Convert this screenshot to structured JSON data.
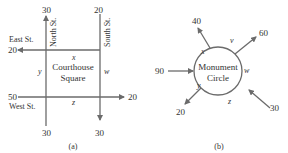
{
  "figure_a": {
    "caption": "(a)",
    "center_label_line1": "Courthouse",
    "center_label_line2": "Square",
    "streets": {
      "north": "North St.",
      "south": "South St.",
      "east": "East St.",
      "west": "West St."
    },
    "flows": {
      "north_top": "30",
      "south_top": "20",
      "east_left": "20",
      "west_left": "50",
      "west_right": "20",
      "north_bottom": "30",
      "south_bottom": "30"
    },
    "variables": {
      "x": "x",
      "y": "y",
      "z": "z",
      "w": "w"
    }
  },
  "figure_b": {
    "caption": "(b)",
    "center_label_line1": "Monument",
    "center_label_line2": "Circle",
    "flows": {
      "left_in": "90",
      "top_left_out": "40",
      "top_right_out": "60",
      "bottom_right_in": "30",
      "bottom_left_out": "20"
    },
    "variables": {
      "x": "x",
      "v": "v",
      "w": "w",
      "y": "y",
      "z": "z"
    }
  },
  "colors": {
    "line": "#6b6b6b",
    "text": "#333333"
  }
}
